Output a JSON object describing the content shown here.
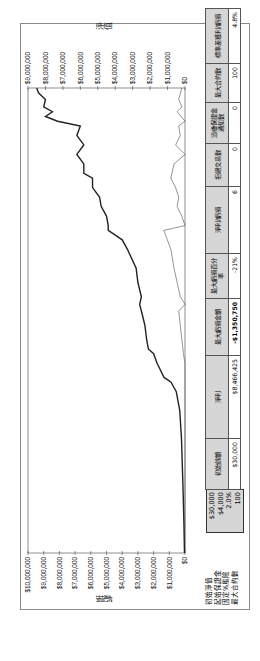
{
  "chart_data": {
    "type": "line",
    "title": "",
    "orientation": "rotated 90° counter-clockwise",
    "series": [
      {
        "name": "淨值",
        "axis": "right",
        "description": "equity curve, rising from $30,000 to ~ $8.5M",
        "points": [
          [
            0,
            0.03
          ],
          [
            30,
            0.06
          ],
          [
            60,
            0.1
          ],
          [
            90,
            0.15
          ],
          [
            120,
            0.2
          ],
          [
            150,
            0.3
          ],
          [
            170,
            0.5
          ],
          [
            180,
            0.8
          ],
          [
            185,
            1.2
          ],
          [
            200,
            1.6
          ],
          [
            210,
            1.8
          ],
          [
            215,
            2.1
          ],
          [
            225,
            2.2
          ],
          [
            240,
            2.3
          ],
          [
            255,
            2.5
          ],
          [
            262,
            2.6
          ],
          [
            270,
            2.5
          ],
          [
            285,
            2.7
          ],
          [
            300,
            2.8
          ],
          [
            320,
            3.3
          ],
          [
            330,
            3.6
          ],
          [
            340,
            4.4
          ],
          [
            345,
            4.4
          ],
          [
            355,
            4.5
          ],
          [
            365,
            4.8
          ],
          [
            375,
            4.9
          ],
          [
            385,
            5.3
          ],
          [
            395,
            5.3
          ],
          [
            400,
            5.8
          ],
          [
            410,
            5.8
          ],
          [
            420,
            6.2
          ],
          [
            430,
            5.8
          ],
          [
            440,
            6.2
          ],
          [
            450,
            6.0
          ],
          [
            455,
            7.3
          ],
          [
            460,
            8.0
          ],
          [
            465,
            7.6
          ],
          [
            470,
            8.1
          ],
          [
            478,
            8.0
          ],
          [
            485,
            8.4
          ],
          [
            490,
            8.5
          ]
        ]
      },
      {
        "name": "虧損",
        "axis": "left",
        "description": "drawdown, hanging from $0; max -$1,350,750",
        "points": [
          [
            0,
            0
          ],
          [
            200,
            0
          ],
          [
            210,
            0.1
          ],
          [
            225,
            0.2
          ],
          [
            240,
            0.3
          ],
          [
            255,
            0.4
          ],
          [
            262,
            0
          ],
          [
            270,
            0.3
          ],
          [
            285,
            0.5
          ],
          [
            300,
            0.7
          ],
          [
            320,
            0.9
          ],
          [
            340,
            1.35
          ],
          [
            345,
            0
          ],
          [
            355,
            0.2
          ],
          [
            365,
            0.5
          ],
          [
            375,
            0.4
          ],
          [
            385,
            0.6
          ],
          [
            395,
            0.9
          ],
          [
            410,
            0.7
          ],
          [
            420,
            0
          ],
          [
            430,
            0.6
          ],
          [
            440,
            0.3
          ],
          [
            450,
            0.4
          ],
          [
            455,
            0
          ],
          [
            465,
            0.5
          ],
          [
            470,
            0.2
          ],
          [
            478,
            0.4
          ],
          [
            490,
            0.2
          ]
        ]
      }
    ],
    "left_axis": {
      "label": "虧損",
      "ticks": [
        "$10,000,000",
        "$9,000,000",
        "$8,000,000",
        "$7,000,000",
        "$6,000,000",
        "$5,000,000",
        "$4,000,000",
        "$3,000,000",
        "$2,000,000",
        "$1,000,000",
        "$0"
      ],
      "range": [
        0,
        10000000
      ],
      "inverted": true
    },
    "right_axis": {
      "label": "淨值",
      "ticks": [
        "$9,000,000",
        "$8,000,000",
        "$7,000,000",
        "$6,000,000",
        "$5,000,000",
        "$4,000,000",
        "$3,000,000",
        "$2,000,000",
        "$1,000,000",
        "$0"
      ],
      "range": [
        0,
        9000000
      ]
    },
    "grid": false,
    "legend": null
  },
  "labels": {
    "left_axis": "虧損",
    "right_axis": "淨值"
  },
  "params": {
    "rows": [
      {
        "label": "初始淨值",
        "value": "$30,000"
      },
      {
        "label": "起始保證金",
        "value": "$4,000"
      },
      {
        "label": "固定%風險",
        "value": "2.0%"
      },
      {
        "label": "最大合約數",
        "value": "100"
      }
    ]
  },
  "stats": {
    "columns": [
      {
        "header": "初始餘額",
        "value": "$30,000"
      },
      {
        "header": "淨利",
        "value": "$8,466,425"
      },
      {
        "header": "最大虧損金額",
        "value": "-$1,350,750"
      },
      {
        "header": "最大虧損百分率",
        "value": "-21%"
      },
      {
        "header": "淨利/虧損",
        "value": "6"
      },
      {
        "header": "拒絕交易數",
        "value": "0"
      },
      {
        "header": "追繳保證金通知數",
        "value": "0"
      },
      {
        "header": "最大合約數",
        "value": "100"
      },
      {
        "header": "標準差獲利/虧損",
        "value": "4.8%"
      }
    ]
  }
}
